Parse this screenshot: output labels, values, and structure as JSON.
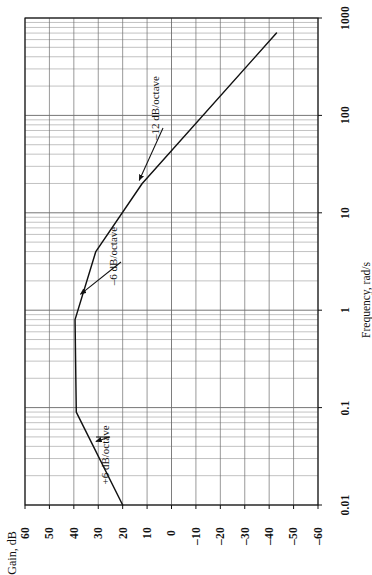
{
  "figure": {
    "orientation": "rotated-90-ccw",
    "background": "#ffffff",
    "ink": "#111111",
    "grid_color": "#6f6f6f"
  },
  "chart_data": {
    "type": "line",
    "title": "",
    "subtitle": "",
    "xlabel": "Frequency, rad/s",
    "ylabel": "Gain, dB",
    "xscale": "log",
    "xlim": [
      0.01,
      1000
    ],
    "ylim": [
      -60,
      60
    ],
    "grid": true,
    "legend": "none",
    "xticks": [
      "0.01",
      "0.1",
      "1",
      "10",
      "100",
      "1000"
    ],
    "xtick_values": [
      0.01,
      0.1,
      1,
      10,
      100,
      1000
    ],
    "yticks": [
      "60",
      "50",
      "40",
      "30",
      "20",
      "10",
      "0",
      "–10",
      "–20",
      "–30",
      "–40",
      "–50",
      "–60"
    ],
    "ytick_values": [
      60,
      50,
      40,
      30,
      20,
      10,
      0,
      -10,
      -20,
      -30,
      -40,
      -50,
      -60
    ],
    "series": [
      {
        "name": "Open-loop gain magnitude",
        "x": [
          0.01,
          0.09,
          0.8,
          4.0,
          20.0,
          700.0
        ],
        "y": [
          20.0,
          39.0,
          39.5,
          31.0,
          12.0,
          -43.0
        ],
        "breakpoints": [
          {
            "freq": 0.09,
            "gain": 39.0,
            "slope": "+6 dB/octave"
          },
          {
            "freq": 0.8,
            "gain": 39.5,
            "slope": "0 dB/octave"
          },
          {
            "freq": 4.0,
            "gain": 31.0,
            "slope": "–6 dB/octave"
          },
          {
            "freq": 20.0,
            "gain": 12.0,
            "slope": "–12 dB/octave"
          }
        ]
      }
    ],
    "annotations": [
      {
        "id": "ann-plus6",
        "text": "+6 dB/octave",
        "target_freq": 0.045,
        "target_gain": 31.0
      },
      {
        "id": "ann-minus6",
        "text": "–6 dB/octave",
        "target_freq": 1.6,
        "target_gain": 36.5
      },
      {
        "id": "ann-minus12",
        "text": "–12 dB/octave",
        "target_freq": 20.0,
        "target_gain": 12.0
      }
    ]
  },
  "axes": {
    "x_axis_label": "Frequency, rad/s",
    "y_axis_label": "Gain, dB",
    "x_tick_labels": [
      "0.01",
      "0.1",
      "1",
      "10",
      "100",
      "1000"
    ],
    "y_tick_labels": [
      "60",
      "50",
      "40",
      "30",
      "20",
      "10",
      "0",
      "–10",
      "–20",
      "–30",
      "–40",
      "–50",
      "–60"
    ]
  },
  "annotations": {
    "plus6": "+6 dB/octave",
    "minus6": "–6 dB/octave",
    "minus12": "–12 dB/octave"
  }
}
